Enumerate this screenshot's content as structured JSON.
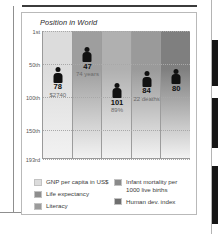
{
  "figure": {
    "title": "Position in World"
  },
  "chart_data": {
    "type": "bar",
    "title": "Position in World",
    "xlabel": "",
    "ylabel": "Position in World",
    "ylim": [
      1,
      193
    ],
    "yticks": [
      "1st",
      "50th",
      "100th",
      "150th",
      "193rd"
    ],
    "ytick_values": [
      1,
      50,
      100,
      150,
      193
    ],
    "grid": true,
    "legend_position": "bottom",
    "marker": "person-icon",
    "categories": [
      "GNP per capita in US$",
      "Life expectancy",
      "Literacy",
      "Infant mortality per 1000 live births",
      "Human dev. index"
    ],
    "values": [
      78,
      47,
      101,
      84,
      80
    ],
    "point_labels": [
      "78",
      "47",
      "101",
      "84",
      "80"
    ],
    "point_sublabels": [
      "$2740",
      "74 years",
      "89%",
      "22 deaths",
      ""
    ],
    "points": [
      {
        "category": "GNP per capita in US$",
        "rank": "78",
        "sub": "$2740",
        "value": 78,
        "column_color": "#dcdcdc"
      },
      {
        "category": "Life expectancy",
        "rank": "47",
        "sub": "74 years",
        "value": 47,
        "column_color": "#9e9e9e"
      },
      {
        "category": "Literacy",
        "rank": "101",
        "sub": "89%",
        "value": 101,
        "column_color": "#b0b0b0"
      },
      {
        "category": "Infant mortality per 1000 live births",
        "rank": "84",
        "sub": "22 deaths",
        "value": 84,
        "column_color": "#9a9a9a"
      },
      {
        "category": "Human dev. index",
        "rank": "80",
        "sub": "",
        "value": 80,
        "column_color": "#7f7f7f"
      }
    ]
  },
  "legend": {
    "left": [
      {
        "label": "GNP per capita in US$",
        "color": "#dcdcdc"
      },
      {
        "label": "Life expectancy",
        "color": "#8e8e8e"
      },
      {
        "label": "Literacy",
        "color": "#9b9b9b"
      }
    ],
    "right": [
      {
        "label": "Infant mortality per 1000 live births",
        "color": "#8a8a8a"
      },
      {
        "label": "Human dev. index",
        "color": "#6f6f6f"
      }
    ]
  }
}
